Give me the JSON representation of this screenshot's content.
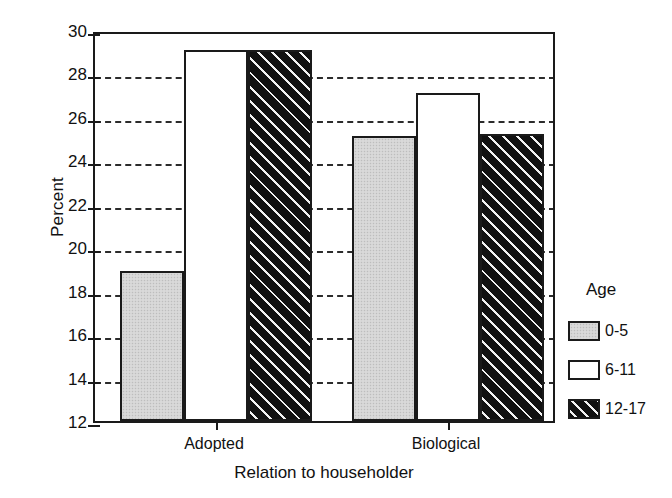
{
  "chart_data": {
    "type": "bar",
    "title": "",
    "xlabel": "Relation to householder",
    "ylabel": "Percent",
    "categories": [
      "Adopted",
      "Biological"
    ],
    "series": [
      {
        "name": "0-5",
        "values": [
          18.9,
          25.1
        ],
        "fill": "gray",
        "color": "#d4d4d4"
      },
      {
        "name": "6-11",
        "values": [
          29.1,
          27.1
        ],
        "fill": "white",
        "color": "#ffffff"
      },
      {
        "name": "12-17",
        "values": [
          29.1,
          25.2
        ],
        "fill": "hatch",
        "color": "#111111"
      }
    ],
    "ylim": [
      12,
      30
    ],
    "yticks": [
      12,
      14,
      16,
      18,
      20,
      22,
      24,
      26,
      28,
      30
    ],
    "ytick_labels": [
      "12",
      "14",
      "16",
      "18",
      "20",
      "22",
      "24",
      "26",
      "28",
      "30"
    ],
    "grid": "horizontal-dashed",
    "legend": {
      "title": "Age",
      "position": "right",
      "entries": [
        "0-5",
        "6-11",
        "12-17"
      ]
    }
  },
  "axes": {
    "y_title": "Percent",
    "x_title": "Relation to householder"
  },
  "legend": {
    "title": "Age",
    "items": [
      {
        "label": "0-5"
      },
      {
        "label": "6-11"
      },
      {
        "label": "12-17"
      }
    ]
  }
}
